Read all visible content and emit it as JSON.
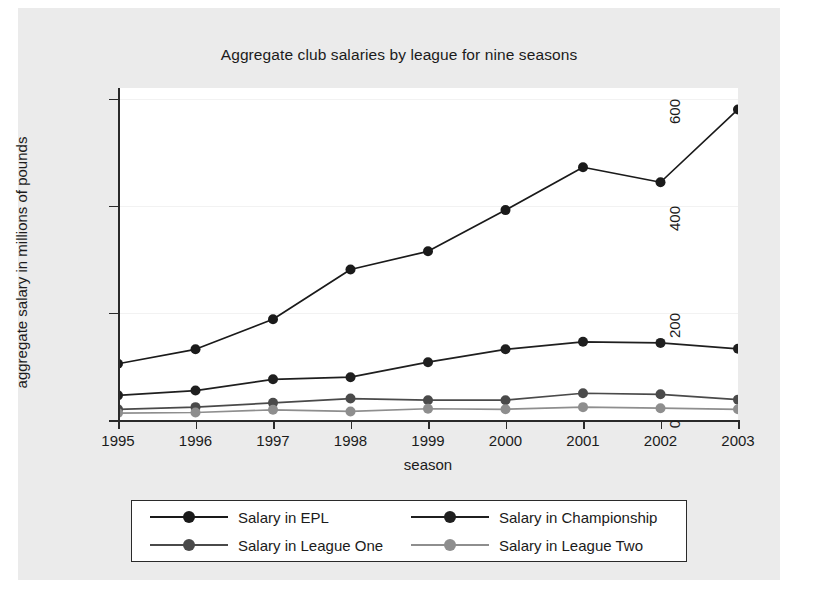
{
  "chart_data": {
    "type": "line",
    "title": "Aggregate club salaries by league for nine seasons",
    "xlabel": "season",
    "ylabel": "aggregate salary in millions of pounds",
    "categories": [
      "1995",
      "1996",
      "1997",
      "1998",
      "1999",
      "2000",
      "2001",
      "2002",
      "2003"
    ],
    "x": [
      1995,
      1996,
      1997,
      1998,
      1999,
      2000,
      2001,
      2002,
      2003
    ],
    "xlim": [
      1995,
      2003
    ],
    "ylim": [
      0,
      620
    ],
    "yticks": [
      0,
      200,
      400,
      600
    ],
    "xticks": [
      "1995",
      "1996",
      "1997",
      "1998",
      "1999",
      "2000",
      "2001",
      "2002",
      "2003"
    ],
    "grid": true,
    "legend_position": "bottom",
    "series": [
      {
        "name": "Salary in EPL",
        "color": "#1a1a1a",
        "marker_color": "#1a1a1a",
        "values": [
          105,
          132,
          188,
          281,
          315,
          392,
          472,
          444,
          580
        ]
      },
      {
        "name": "Salary in Championship",
        "color": "#1f1f1f",
        "marker_color": "#1f1f1f",
        "values": [
          46,
          55,
          76,
          80,
          108,
          132,
          146,
          144,
          133
        ]
      },
      {
        "name": "Salary in League One",
        "color": "#4a4a4a",
        "marker_color": "#4a4a4a",
        "values": [
          20,
          24,
          32,
          40,
          37,
          37,
          50,
          48,
          38
        ]
      },
      {
        "name": "Salary in League Two",
        "color": "#8e8e8e",
        "marker_color": "#8e8e8e",
        "values": [
          13,
          14,
          19,
          16,
          21,
          20,
          24,
          22,
          20
        ]
      }
    ]
  },
  "legend": {
    "entries": [
      {
        "label": "Salary in EPL"
      },
      {
        "label": "Salary in Championship"
      },
      {
        "label": "Salary in League One"
      },
      {
        "label": "Salary in League Two"
      }
    ]
  }
}
